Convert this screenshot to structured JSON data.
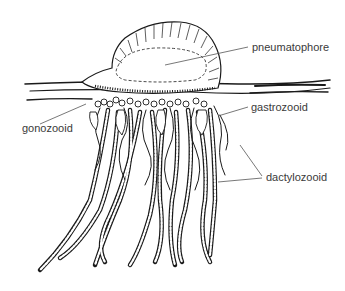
{
  "diagram": {
    "labels": {
      "pneumatophore": "pneumatophore",
      "gastrozooid": "gastrozooid",
      "gonozooid": "gonozooid",
      "dactylozooid": "dactylozooid"
    },
    "colors": {
      "ink": "#1a1a1a",
      "leader": "#555555",
      "label_text": "#3a3a3a",
      "background": "#ffffff"
    }
  }
}
